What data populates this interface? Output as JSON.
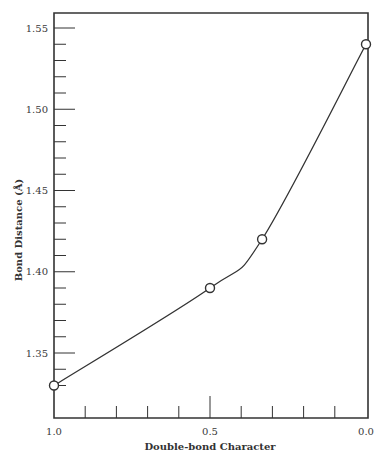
{
  "chart_data": {
    "type": "line",
    "title": "",
    "xlabel": "Double-bond Character",
    "ylabel": "Bond Distance (Å)",
    "xlim": [
      1.0,
      0.0
    ],
    "ylim": [
      1.32,
      1.56
    ],
    "x_reversed": true,
    "grid": false,
    "legend": null,
    "x_tick_labels": [
      "1.0",
      "0.5",
      "0.0"
    ],
    "x_ticks_major": [
      1.0,
      0.5,
      0.0
    ],
    "x_ticks_minor": [
      0.9,
      0.8,
      0.7,
      0.6,
      0.4,
      0.3,
      0.2,
      0.1
    ],
    "y_tick_labels": [
      "1.35",
      "1.40",
      "1.45",
      "1.50",
      "1.55"
    ],
    "y_ticks_major": [
      1.35,
      1.4,
      1.45,
      1.5,
      1.55
    ],
    "y_ticks_minor": [
      1.33,
      1.34,
      1.36,
      1.37,
      1.38,
      1.39,
      1.41,
      1.42,
      1.43,
      1.44,
      1.46,
      1.47,
      1.48,
      1.49,
      1.51,
      1.52,
      1.53,
      1.54
    ],
    "series": [
      {
        "name": "Bond distance vs double-bond character",
        "marker": "open-circle",
        "points": [
          {
            "x": 1.0,
            "y": 1.33
          },
          {
            "x": 0.5,
            "y": 1.39
          },
          {
            "x": 0.333,
            "y": 1.42
          },
          {
            "x": 0.0,
            "y": 1.54
          }
        ]
      }
    ],
    "curve": "smooth"
  },
  "colors": {
    "ink": "#333333",
    "background": "#ffffff"
  }
}
